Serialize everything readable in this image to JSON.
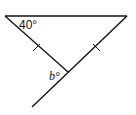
{
  "diagram": {
    "type": "triangle-with-extended-side",
    "vertices": {
      "top_left": [
        5,
        16
      ],
      "top_right": [
        127,
        16
      ],
      "bottom": [
        68,
        72
      ],
      "extension_end": [
        32,
        107
      ]
    },
    "labels": {
      "angle_top_left": "40°",
      "angle_bottom": "b°"
    },
    "tick_marks": [
      "left-side",
      "right-side"
    ],
    "stroke_color": "#111111"
  }
}
